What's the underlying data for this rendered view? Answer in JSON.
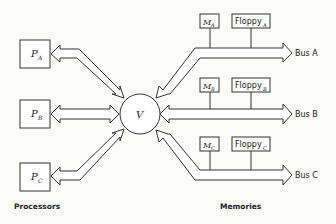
{
  "diagram": {
    "hub": {
      "label": "V"
    },
    "processors": [
      {
        "name": "P",
        "sub": "A"
      },
      {
        "name": "P",
        "sub": "B"
      },
      {
        "name": "P",
        "sub": "C"
      }
    ],
    "memories": [
      {
        "m_name": "M",
        "m_sub": "A",
        "floppy": "Floppy",
        "floppy_sub": "A",
        "bus": "Bus A"
      },
      {
        "m_name": "M",
        "m_sub": "B",
        "floppy": "Floppy",
        "floppy_sub": "B",
        "bus": "Bus B"
      },
      {
        "m_name": "M",
        "m_sub": "C",
        "floppy": "Floppy",
        "floppy_sub": "C",
        "bus": "Bus C"
      }
    ],
    "captions": {
      "left": "Processors",
      "right": "Memories"
    }
  }
}
